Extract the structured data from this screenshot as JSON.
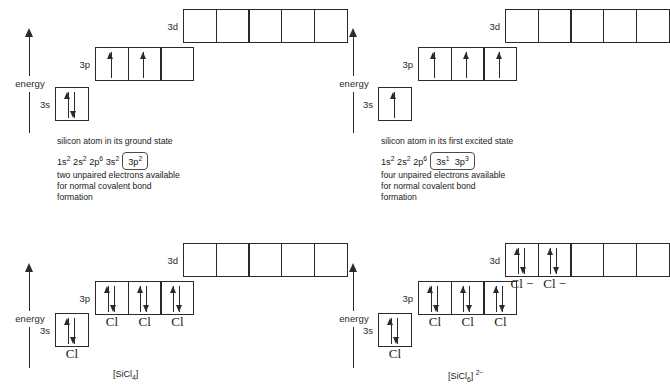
{
  "diagram": {
    "axis_label": "energy",
    "orbital_labels": {
      "s": "3s",
      "p": "3p",
      "d": "3d"
    },
    "ligand": "Cl",
    "ligand_anion": "Cl −"
  },
  "panels": [
    {
      "id": "ground-state",
      "caption": "silicon atom in its ground state",
      "config_plain": "1s2 2s2 2p6 3s2",
      "config_boxed": "3p2",
      "config_plain_parts": [
        {
          "base": "1s",
          "sup": "2"
        },
        {
          "base": "2s",
          "sup": "2"
        },
        {
          "base": "2p",
          "sup": "6"
        },
        {
          "base": "3s",
          "sup": "2"
        }
      ],
      "config_boxed_parts": [
        {
          "base": "3p",
          "sup": "2"
        }
      ],
      "note_line1": "two unpaired electrons available",
      "note_line2": "for normal covalent bond",
      "note_line3": "formation",
      "orbitals": {
        "s": {
          "label": "3s",
          "boxes": [
            [
              "up",
              "down"
            ]
          ],
          "ligands": []
        },
        "p": {
          "label": "3p",
          "boxes": [
            [
              "up"
            ],
            [
              "up"
            ],
            []
          ],
          "ligands": []
        },
        "d": {
          "label": "3d",
          "boxes": [
            [],
            [],
            [],
            [],
            []
          ],
          "ligands": []
        }
      },
      "species": ""
    },
    {
      "id": "excited-state",
      "caption": "silicon atom in its first excited state",
      "config_plain": "1s2 2s2 2p6",
      "config_boxed": "3s1 3p3",
      "config_plain_parts": [
        {
          "base": "1s",
          "sup": "2"
        },
        {
          "base": "2s",
          "sup": "2"
        },
        {
          "base": "2p",
          "sup": "6"
        }
      ],
      "config_boxed_parts": [
        {
          "base": "3s",
          "sup": "1"
        },
        {
          "base": "3p",
          "sup": "3"
        }
      ],
      "note_line1": "four unpaired electrons available",
      "note_line2": "for normal covalent bond",
      "note_line3": "formation",
      "orbitals": {
        "s": {
          "label": "3s",
          "boxes": [
            [
              "up"
            ]
          ],
          "ligands": []
        },
        "p": {
          "label": "3p",
          "boxes": [
            [
              "up"
            ],
            [
              "up"
            ],
            [
              "up"
            ]
          ],
          "ligands": []
        },
        "d": {
          "label": "3d",
          "boxes": [
            [],
            [],
            [],
            [],
            []
          ],
          "ligands": []
        }
      },
      "species": ""
    },
    {
      "id": "sicl4",
      "caption": "",
      "orbitals": {
        "s": {
          "label": "3s",
          "boxes": [
            [
              "up",
              "down"
            ]
          ],
          "ligands": [
            "Cl"
          ]
        },
        "p": {
          "label": "3p",
          "boxes": [
            [
              "up",
              "down"
            ],
            [
              "up",
              "down"
            ],
            [
              "up",
              "down"
            ]
          ],
          "ligands": [
            "Cl",
            "Cl",
            "Cl"
          ]
        },
        "d": {
          "label": "3d",
          "boxes": [
            [],
            [],
            [],
            [],
            []
          ],
          "ligands": []
        }
      },
      "species_base": "[SiCl",
      "species_sub": "4",
      "species_tail": "]",
      "species_charge": ""
    },
    {
      "id": "sicl6-2minus",
      "caption": "",
      "orbitals": {
        "s": {
          "label": "3s",
          "boxes": [
            [
              "up",
              "down"
            ]
          ],
          "ligands": [
            "Cl"
          ]
        },
        "p": {
          "label": "3p",
          "boxes": [
            [
              "up",
              "down"
            ],
            [
              "up",
              "down"
            ],
            [
              "up",
              "down"
            ]
          ],
          "ligands": [
            "Cl",
            "Cl",
            "Cl"
          ]
        },
        "d": {
          "label": "3d",
          "boxes": [
            [
              "up",
              "down"
            ],
            [
              "up",
              "down"
            ],
            [],
            [],
            []
          ],
          "ligands": [
            "Cl −",
            "Cl −"
          ]
        }
      },
      "species_base": "[SiCl",
      "species_sub": "6",
      "species_tail": "]",
      "species_charge": "2−"
    }
  ]
}
